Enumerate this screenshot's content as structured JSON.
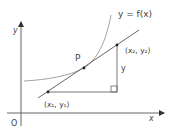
{
  "diagram": {
    "axes": {
      "x_label": "x",
      "y_label": "y",
      "origin_label": "O"
    },
    "curve": {
      "label": "y = f(x)"
    },
    "points": {
      "p_label": "P",
      "point1_label": "(x₁, y₁)",
      "point2_label": "(x₂, y₂)"
    },
    "rise_label": "y",
    "colors": {
      "axis": "#555555",
      "curve": "#999999",
      "line": "#555555",
      "text": "#444444"
    }
  }
}
